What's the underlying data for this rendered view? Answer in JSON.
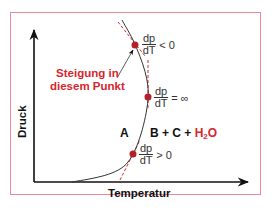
{
  "diagram": {
    "type": "phase-diagram",
    "axes": {
      "x_label": "Temperatur",
      "y_label": "Druck"
    },
    "annotation": {
      "line1": "Steigung in",
      "line2": "diesem Punkt"
    },
    "regions": {
      "left": "A",
      "right_prefix": "B + C + ",
      "right_h2o_main": "H",
      "right_h2o_sub": "2",
      "right_h2o_tail": "O"
    },
    "points": [
      {
        "num": "dp",
        "den": "dT",
        "relation": "< 0"
      },
      {
        "num": "dp",
        "den": "dT",
        "relation": "= ∞"
      },
      {
        "num": "dp",
        "den": "dT",
        "relation": "> 0"
      }
    ],
    "colors": {
      "frame": "#e98a96",
      "accent_red": "#d6262e",
      "point": "#b3202a",
      "curve": "#333333"
    }
  }
}
